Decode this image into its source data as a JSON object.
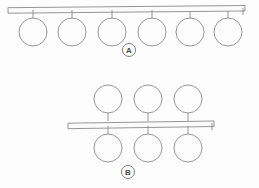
{
  "diagram": {
    "background_color": "#fdfdfd",
    "line_color": "#8a8a8a",
    "groups": [
      {
        "id": "A",
        "label": "A",
        "label_center": {
          "x": 129,
          "y": 50
        },
        "label_radius": 6.5,
        "rail": {
          "name": "rail-a",
          "x1": 8,
          "x2": 245,
          "y_top": 5.5,
          "y_bottom": 11,
          "end_cap_x": 243,
          "end_cap_y1": 8,
          "end_cap_y2": 15
        },
        "nodes_below": [
          {
            "cx": 33,
            "cy": 32,
            "r": 14,
            "stem_x": 33,
            "stem_y1": 10,
            "stem_y2": 18
          },
          {
            "cx": 72,
            "cy": 32,
            "r": 14,
            "stem_x": 72,
            "stem_y1": 10,
            "stem_y2": 18
          },
          {
            "cx": 112,
            "cy": 32,
            "r": 14,
            "stem_x": 112,
            "stem_y1": 10,
            "stem_y2": 18
          },
          {
            "cx": 152,
            "cy": 32,
            "r": 14,
            "stem_x": 152,
            "stem_y1": 10,
            "stem_y2": 18
          },
          {
            "cx": 190,
            "cy": 32,
            "r": 14,
            "stem_x": 190,
            "stem_y1": 11,
            "stem_y2": 18
          },
          {
            "cx": 228,
            "cy": 32,
            "r": 14,
            "stem_x": 228,
            "stem_y1": 11,
            "stem_y2": 18
          }
        ],
        "nodes_above": [],
        "node_count_below": 6,
        "node_count_above": 0
      },
      {
        "id": "B",
        "label": "B",
        "label_center": {
          "x": 128,
          "y": 172
        },
        "label_radius": 6.5,
        "rail": {
          "name": "rail-b",
          "x1": 68,
          "x2": 214,
          "y_top": 121,
          "y_bottom": 126.5,
          "end_cap_x": 212,
          "end_cap_y1": 123,
          "end_cap_y2": 130
        },
        "nodes_above": [
          {
            "cx": 108,
            "cy": 99,
            "r": 14,
            "stem_x": 108,
            "stem_y1": 113,
            "stem_y2": 121
          },
          {
            "cx": 148,
            "cy": 99,
            "r": 14,
            "stem_x": 148,
            "stem_y1": 113,
            "stem_y2": 121
          },
          {
            "cx": 188,
            "cy": 99,
            "r": 14,
            "stem_x": 188,
            "stem_y1": 113,
            "stem_y2": 121
          }
        ],
        "nodes_below": [
          {
            "cx": 108,
            "cy": 148,
            "r": 14,
            "stem_x": 108,
            "stem_y1": 126,
            "stem_y2": 134
          },
          {
            "cx": 148,
            "cy": 148,
            "r": 14,
            "stem_x": 148,
            "stem_y1": 126,
            "stem_y2": 134
          },
          {
            "cx": 188,
            "cy": 148,
            "r": 14,
            "stem_x": 188,
            "stem_y1": 126,
            "stem_y2": 134
          }
        ],
        "node_count_above": 3,
        "node_count_below": 3
      }
    ]
  }
}
